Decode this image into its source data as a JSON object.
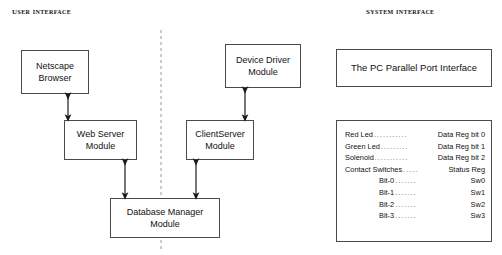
{
  "headings": {
    "user_interface": "User Interface",
    "system_interface": "System Interface"
  },
  "boxes": {
    "netscape": {
      "line1": "Netscape",
      "line2": "Browser"
    },
    "web_server": {
      "line1": "Web Server",
      "line2": "Module"
    },
    "device_driver": {
      "line1": "Device Driver",
      "line2": "Module"
    },
    "client_server": {
      "line1": "ClientServer",
      "line2": "Module"
    },
    "database_manager": {
      "line1": "Database Manager",
      "line2": "Module"
    },
    "parallel_port": {
      "line1": "The PC Parallel Port Interface"
    }
  },
  "register_map": {
    "rows": [
      {
        "label": "Red Led",
        "dots": "...........",
        "value": "Data Reg bit 0",
        "indent": false
      },
      {
        "label": "Green Led",
        "dots": ".........",
        "value": "Data Reg bit 1",
        "indent": false
      },
      {
        "label": "Solenoid",
        "dots": "...........",
        "value": "Data Reg bit 2",
        "indent": false
      },
      {
        "label": "Contact Switches",
        "dots": ".....",
        "value": "Status Reg",
        "indent": false
      },
      {
        "label": "Bit-0",
        "dots": ".......",
        "value": "Sw0",
        "indent": true
      },
      {
        "label": "Bit-1",
        "dots": ".......",
        "value": "Sw1",
        "indent": true
      },
      {
        "label": "Bit-2",
        "dots": ".......",
        "value": "Sw2",
        "indent": true
      },
      {
        "label": "Bit-3",
        "dots": ".......",
        "value": "Sw3",
        "indent": true
      }
    ]
  },
  "colors": {
    "box_border": "#4a4a4a",
    "arrow": "#1a1a1a",
    "divider": "#999999",
    "background": "#ffffff"
  }
}
